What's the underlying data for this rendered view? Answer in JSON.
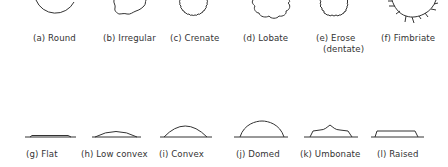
{
  "figure": {
    "top_row": [
      {
        "id": "a",
        "label": "(a) Round",
        "name": "Round"
      },
      {
        "id": "b",
        "label": "(b) Irregular",
        "name": "Irregular"
      },
      {
        "id": "c",
        "label": "(c) Crenate",
        "name": "Crenate"
      },
      {
        "id": "d",
        "label": "(d) Lobate",
        "name": "Lobate"
      },
      {
        "id": "e",
        "label": "(e) Erose",
        "sublabel": "(dentate)",
        "name": "Erose (dentate)"
      },
      {
        "id": "f",
        "label": "(f) Fimbriate",
        "name": "Fimbriate"
      }
    ],
    "bottom_row": [
      {
        "id": "g",
        "label": "(g) Flat",
        "name": "Flat"
      },
      {
        "id": "h",
        "label": "(h) Low convex",
        "name": "Low convex"
      },
      {
        "id": "i",
        "label": "(i) Convex",
        "name": "Convex"
      },
      {
        "id": "j",
        "label": "(j) Domed",
        "name": "Domed"
      },
      {
        "id": "k",
        "label": "(k) Umbonate",
        "name": "Umbonate"
      },
      {
        "id": "l",
        "label": "(l) Raised",
        "name": "Raised"
      }
    ]
  }
}
